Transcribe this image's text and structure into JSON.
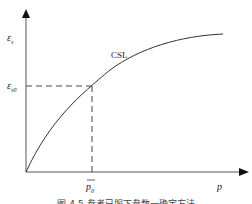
{
  "diagram": {
    "y_axis_label": "ε",
    "y_axis_sub": "v",
    "y_marker_label": "ε",
    "y_marker_sub": "v0",
    "x_axis_label": "p",
    "x_marker_label": "p",
    "x_marker_sub": "0",
    "curve_label": "CSL",
    "caption": "图 4-5  参考已服下参数一确定方法"
  },
  "colors": {
    "line": "#333333",
    "dash": "#444444",
    "background": "#ffffff"
  }
}
